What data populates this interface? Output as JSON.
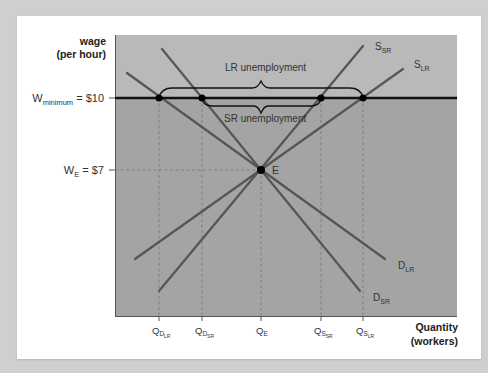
{
  "axes": {
    "y_label_line1": "wage",
    "y_label_line2": "(per hour)",
    "x_label_line1": "Quantity",
    "x_label_line2": "(workers)"
  },
  "wage_levels": {
    "minimum": {
      "prefix": "W",
      "sub": "minimum",
      "value": " = $10"
    },
    "equilibrium": {
      "prefix": "W",
      "sub": "E",
      "value": " = $7"
    }
  },
  "quantity_ticks": [
    {
      "main": "Q",
      "sub": "D",
      "subsub": "LR"
    },
    {
      "main": "Q",
      "sub": "D",
      "subsub": "SR"
    },
    {
      "main": "Q",
      "sub": "E",
      "subsub": ""
    },
    {
      "main": "Q",
      "sub": "S",
      "subsub": "SR"
    },
    {
      "main": "Q",
      "sub": "S",
      "subsub": "LR"
    }
  ],
  "curves": {
    "s_sr": {
      "main": "S",
      "sub": "SR"
    },
    "s_lr": {
      "main": "S",
      "sub": "LR"
    },
    "d_lr": {
      "main": "D",
      "sub": "LR"
    },
    "d_sr": {
      "main": "D",
      "sub": "SR"
    }
  },
  "annotations": {
    "equilibrium_point": "E",
    "lr_unemployment": "LR unemployment",
    "sr_unemployment": "SR unemployment"
  },
  "colors": {
    "page_bg": "#cfcfcf",
    "card_bg": "#ffffff",
    "plot_upper": "#b9b9b9",
    "plot_lower": "#a4a4a4",
    "curve": "#555555",
    "min_wage_line": "#111111",
    "dashed": "#777777"
  }
}
